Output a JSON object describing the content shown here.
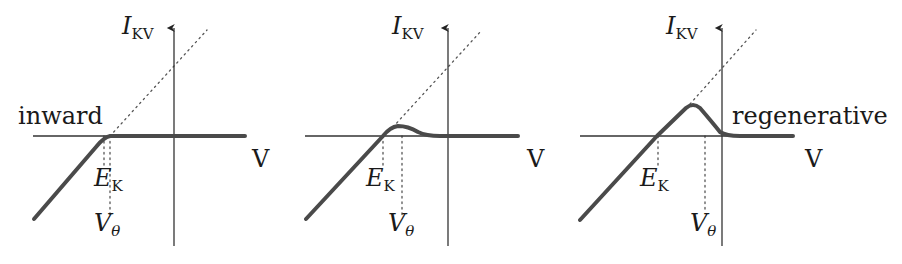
{
  "figure": {
    "colors": {
      "axis": "#333333",
      "curve": "#4a4a4a",
      "dotted": "#555555",
      "text": "#1a1a1a"
    },
    "panels": [
      {
        "id": "inward",
        "label": "inward",
        "y_axis_label": {
          "main": "I",
          "sub": "KV"
        },
        "x_axis_label": "V",
        "ek_label": {
          "main": "E",
          "sub": "K"
        },
        "vtheta_label": {
          "main": "V",
          "sub": "θ"
        },
        "axes": {
          "x0": 33,
          "x1": 245,
          "y": 136,
          "vx": 174,
          "vtop": 26,
          "vbot": 246
        },
        "curve": "M34,219 L96,147 Q104,137 110,136 L245,136",
        "diag": "M110,136 L207,30",
        "ek_x": 104,
        "vtheta_x": 110,
        "ek_dot_bottom": 165,
        "vtheta_dot_bottom": 215,
        "label_pos": {
          "panel_label": [
            18,
            104
          ],
          "ylab": [
            122,
            18
          ],
          "xlab": [
            254,
            147
          ],
          "ek": [
            96,
            166
          ],
          "vt": [
            96,
            212
          ]
        }
      },
      {
        "id": "weak",
        "label": "",
        "y_axis_label": {
          "main": "I",
          "sub": "KV"
        },
        "x_axis_label": "V",
        "ek_label": {
          "main": "E",
          "sub": "K"
        },
        "vtheta_label": {
          "main": "V",
          "sub": "θ"
        },
        "axes": {
          "x0": 305,
          "x1": 518,
          "y": 136,
          "vx": 448,
          "vtop": 26,
          "vbot": 246
        },
        "curve": "M306,219 L383,136 Q390,127 398,126 Q408,126 418,132 Q426,136 440,136 L518,136",
        "diag": "M393,127 L482,30",
        "ek_x": 383,
        "vtheta_x": 402,
        "ek_dot_bottom": 165,
        "vtheta_dot_bottom": 215,
        "label_pos": {
          "panel_label": [
            0,
            0
          ],
          "ylab": [
            392,
            18
          ],
          "xlab": [
            528,
            147
          ],
          "ek": [
            368,
            166
          ],
          "vt": [
            388,
            212
          ]
        }
      },
      {
        "id": "regenerative",
        "label": "regenerative",
        "y_axis_label": {
          "main": "I",
          "sub": "KV"
        },
        "x_axis_label": "V",
        "ek_label": {
          "main": "E",
          "sub": "K"
        },
        "vtheta_label": {
          "main": "V",
          "sub": "θ"
        },
        "axes": {
          "x0": 580,
          "x1": 793,
          "y": 136,
          "vx": 722,
          "vtop": 26,
          "vbot": 246
        },
        "curve": "M580,220 L657,136 L686,108 Q693,102 700,108 Q712,122 720,132 Q726,136 740,136 L793,136",
        "diag": "M690,104 L756,30",
        "ek_x": 658,
        "vtheta_x": 705,
        "ek_dot_bottom": 165,
        "vtheta_dot_bottom": 212,
        "label_pos": {
          "panel_label": [
            732,
            104
          ],
          "ylab": [
            667,
            18
          ],
          "xlab": [
            806,
            147
          ],
          "ek": [
            641,
            166
          ],
          "vt": [
            691,
            212
          ]
        }
      }
    ]
  }
}
